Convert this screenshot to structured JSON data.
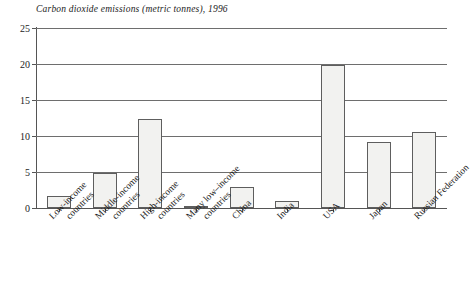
{
  "chart_data": {
    "type": "bar",
    "title": "Carbon dioxide emissions (metric tonnes), 1996",
    "xlabel": "",
    "ylabel": "",
    "ylim": [
      0,
      25
    ],
    "yticks": [
      0,
      5,
      10,
      15,
      20,
      25
    ],
    "grid": true,
    "legend": "none",
    "categories": [
      "Low-income countries",
      "Middle-income countries",
      "High-income countries",
      "Many low–income countries",
      "China",
      "India",
      "USA",
      "Japan",
      "Russian Federation"
    ],
    "category_lines": [
      [
        "Low-income",
        "countries"
      ],
      [
        "Middle-income",
        "countries"
      ],
      [
        "High-income",
        "countries"
      ],
      [
        "Many low–income",
        "countries"
      ],
      [
        "China",
        ""
      ],
      [
        "India",
        ""
      ],
      [
        "USA",
        ""
      ],
      [
        "Japan",
        ""
      ],
      [
        "Russian Federation",
        ""
      ]
    ],
    "values": [
      1.6,
      4.8,
      12.3,
      0.2,
      2.9,
      1.0,
      19.9,
      9.1,
      10.6
    ],
    "bar_fill": "#f2f2f0",
    "bar_stroke": "#5e5e5e",
    "grid_color": "#6e6e6e",
    "axis_color": "#555555",
    "background": "#ffffff"
  },
  "ytick_labels": [
    "0",
    "5",
    "10",
    "15",
    "20",
    "25"
  ]
}
